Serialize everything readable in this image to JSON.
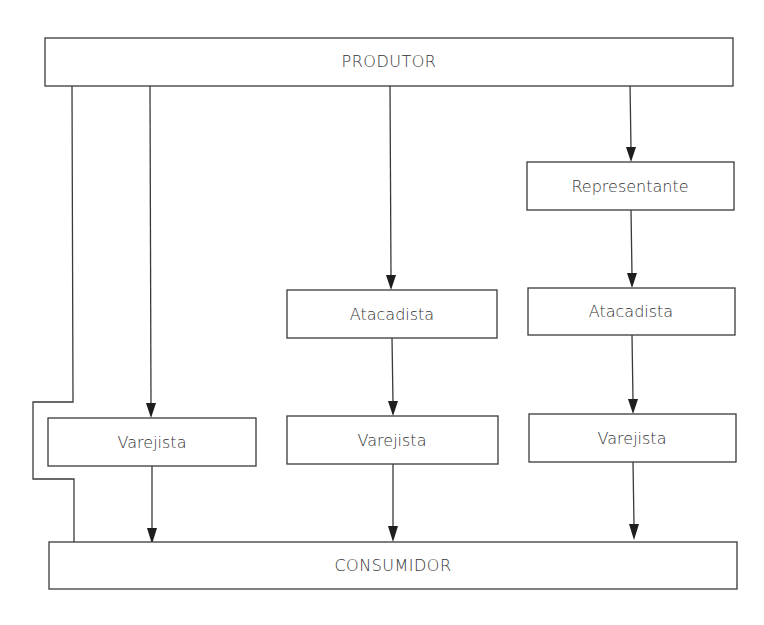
{
  "diagram": {
    "type": "distribution-channels-flowchart",
    "colors": {
      "stroke": "#3a3a3a",
      "text": "#333333",
      "arrowhead": "#1e1e1e",
      "background": "#ffffff"
    },
    "nodes": {
      "produtor": {
        "label": "PRODUTOR"
      },
      "representante": {
        "label": "Representante"
      },
      "atacadista_mid": {
        "label": "Atacadista"
      },
      "atacadista_right": {
        "label": "Atacadista"
      },
      "varejista_left": {
        "label": "Varejista"
      },
      "varejista_mid": {
        "label": "Varejista"
      },
      "varejista_right": {
        "label": "Varejista"
      },
      "consumidor": {
        "label": "CONSUMIDOR"
      }
    },
    "channels": [
      {
        "name": "direct",
        "path": [
          "PRODUTOR",
          "CONSUMIDOR"
        ]
      },
      {
        "name": "one-level",
        "path": [
          "PRODUTOR",
          "Varejista",
          "CONSUMIDOR"
        ]
      },
      {
        "name": "two-level",
        "path": [
          "PRODUTOR",
          "Atacadista",
          "Varejista",
          "CONSUMIDOR"
        ]
      },
      {
        "name": "three-level",
        "path": [
          "PRODUTOR",
          "Representante",
          "Atacadista",
          "Varejista",
          "CONSUMIDOR"
        ]
      }
    ]
  }
}
